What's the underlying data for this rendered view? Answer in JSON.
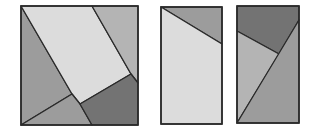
{
  "colors": {
    "background": "#ffffff",
    "stroke": "#2a2a2a",
    "light": "#dcdcdc",
    "medium_light": "#b4b4b4",
    "medium": "#9c9c9c",
    "dark": "#737373"
  },
  "figures": [
    {
      "name": "square-dissection",
      "pieces": [
        {
          "name": "left-triangle-piece",
          "fill": "medium",
          "points": "21,6 72,94 21,125"
        },
        {
          "name": "center-light-piece",
          "fill": "light",
          "points": "21,6 92,6 131,74 80,104 72,94"
        },
        {
          "name": "top-right-piece",
          "fill": "medium_light",
          "points": "92,6 138,6 138,83 131,74"
        },
        {
          "name": "bottom-left-piece",
          "fill": "medium",
          "points": "21,125 72,94 80,104 92,125"
        },
        {
          "name": "bottom-right-dark-piece",
          "fill": "dark",
          "points": "80,104 131,74 138,83 138,125 92,125"
        }
      ],
      "outline": "21,6 138,6 138,125 21,125"
    },
    {
      "name": "rectangle-two-pieces",
      "pieces": [
        {
          "name": "top-dark-triangle",
          "fill": "medium",
          "points": "161,7 222,7 222,44"
        },
        {
          "name": "light-trapezoid",
          "fill": "light",
          "points": "161,7 222,44 222,124 161,124"
        }
      ],
      "outline": "161,7 222,7 222,124 161,124"
    },
    {
      "name": "rectangle-three-pieces",
      "pieces": [
        {
          "name": "top-dark-piece",
          "fill": "dark",
          "points": "237,6 299,6 299,20 279,54 237,31"
        },
        {
          "name": "left-medium-piece",
          "fill": "medium_light",
          "points": "237,31 279,54 237,123"
        },
        {
          "name": "right-medium-piece",
          "fill": "medium",
          "points": "299,20 299,123 237,123"
        }
      ],
      "outline": "237,6 299,6 299,123 237,123"
    }
  ]
}
